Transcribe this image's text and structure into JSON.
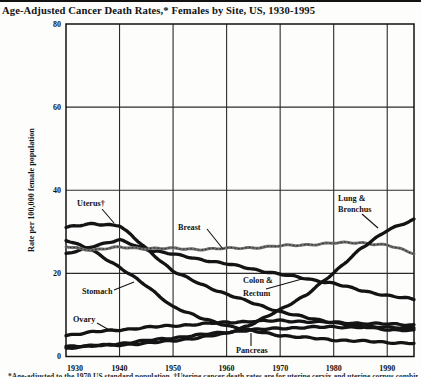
{
  "page": {
    "title": "Age-Adjusted Cancer Death Rates,* Females by Site, US, 1930-1995",
    "footnote_partial": "*Age-adjusted to the 1970 US standard population. †Uterine cancer death rates are for uterine cervix and uterine corpus combined.",
    "background": "#fdfdfc",
    "ink": "#121212"
  },
  "chart_data": {
    "type": "line",
    "title": "Age-Adjusted Cancer Death Rates,* Females by Site, US, 1930-1995",
    "xlabel": "",
    "ylabel": "Rate per 100,000 female population",
    "xlim": [
      1930,
      1995
    ],
    "ylim": [
      0,
      80
    ],
    "x_ticks": [
      1930,
      1940,
      1950,
      1960,
      1970,
      1980,
      1990
    ],
    "y_ticks": [
      0,
      20,
      40,
      60,
      80
    ],
    "grid": true,
    "legend": "inline-annotations",
    "x": [
      1930,
      1935,
      1940,
      1945,
      1950,
      1955,
      1960,
      1965,
      1970,
      1975,
      1980,
      1985,
      1990,
      1995
    ],
    "series": [
      {
        "name": "Uterus†",
        "color": "#141414",
        "values": [
          31,
          32,
          31.5,
          26,
          20.5,
          17.5,
          15,
          12.8,
          10.8,
          9.3,
          8.2,
          7.2,
          6.5,
          6.2
        ],
        "annotation": {
          "lines": [
            {
              "text": "Uterus†",
              "x": 77,
              "y": 206
            }
          ],
          "leader": [
            102,
            209,
            114,
            223
          ]
        }
      },
      {
        "name": "Stomach",
        "color": "#141414",
        "values": [
          28,
          25.5,
          21.5,
          17,
          12,
          9.3,
          7.5,
          6.1,
          5.1,
          4.5,
          4,
          3.7,
          3.4,
          3.2
        ],
        "annotation": {
          "lines": [
            {
              "text": "Stomach",
              "x": 82,
              "y": 294
            }
          ],
          "leader": [
            114,
            290,
            134,
            282
          ]
        }
      },
      {
        "name": "Breast",
        "color": "#6f6f6f",
        "values": [
          26.5,
          25.6,
          26.3,
          26,
          26,
          25.8,
          26,
          26.2,
          26.6,
          26.9,
          27.3,
          27.4,
          26.8,
          24.8
        ],
        "annotation": {
          "lines": [
            {
              "text": "Breast",
              "x": 178,
              "y": 230
            }
          ],
          "leader": [
            207,
            229,
            223,
            249
          ]
        }
      },
      {
        "name": "Colon & Rectum",
        "color": "#141414",
        "values": [
          24.6,
          26.6,
          28,
          25.8,
          24.6,
          23.4,
          22.3,
          21,
          19.8,
          18.7,
          17.6,
          15.9,
          14.7,
          13.7
        ],
        "annotation": {
          "lines": [
            {
              "text": "Colon &",
              "x": 243,
              "y": 283
            },
            {
              "text": "Rectum",
              "x": 243,
              "y": 296
            }
          ],
          "leader": [
            266,
            289,
            302,
            279
          ]
        }
      },
      {
        "name": "Ovary",
        "color": "#141414",
        "values": [
          5.1,
          5.9,
          6.4,
          7,
          7.4,
          7.8,
          8.2,
          8.5,
          8.6,
          8.4,
          8.2,
          8,
          7.8,
          7.6
        ],
        "annotation": {
          "lines": [
            {
              "text": "Ovary",
              "x": 73,
              "y": 322
            }
          ],
          "leader": [
            97,
            323,
            111,
            331
          ]
        }
      },
      {
        "name": "Pancreas",
        "color": "#141414",
        "values": [
          2,
          2.5,
          3.1,
          3.8,
          4.5,
          5.2,
          5.9,
          6.4,
          6.8,
          7,
          7.1,
          7.1,
          7,
          7
        ],
        "annotation": {
          "lines": [
            {
              "text": "Pancreas",
              "x": 236,
              "y": 353
            }
          ],
          "leader": [
            251,
            346,
            251,
            333
          ]
        }
      },
      {
        "name": "Lung & Bronchus",
        "color": "#141414",
        "values": [
          2.5,
          2.6,
          2.8,
          3.2,
          3.8,
          4.6,
          5.5,
          8,
          11.2,
          15,
          20,
          26,
          30.3,
          33
        ],
        "annotation": {
          "lines": [
            {
              "text": "Lung &",
              "x": 338,
              "y": 201
            },
            {
              "text": "Bronchus",
              "x": 338,
              "y": 212
            }
          ],
          "leader": [
            362,
            214,
            378,
            228
          ]
        }
      }
    ]
  }
}
